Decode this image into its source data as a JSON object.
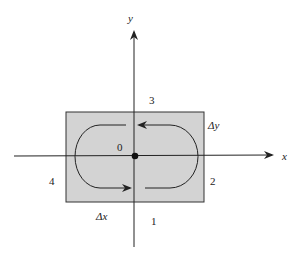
{
  "diagram": {
    "axes": {
      "x_label": "x",
      "y_label": "y"
    },
    "origin_label": "0",
    "region_labels": {
      "r1": "1",
      "r2": "2",
      "r3": "3",
      "r4": "4"
    },
    "dimension_labels": {
      "dx": "Δx",
      "dy": "Δy"
    },
    "colors": {
      "rect_fill": "#d3d3d3",
      "stroke": "#222222",
      "background": "#ffffff"
    }
  }
}
